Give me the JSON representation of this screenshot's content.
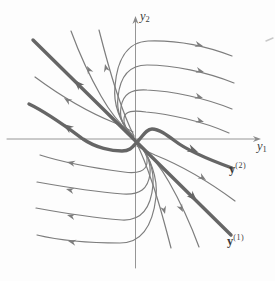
{
  "figure": {
    "colors": {
      "background": "#fdfdfd",
      "axis": "#8a8a8a",
      "thin_curve": "#7d7d7d",
      "thick_curve": "#666666",
      "text": "#3a3a3a",
      "artifact": "#c9c9c9"
    },
    "labels": {
      "x_axis": {
        "base": "y",
        "sub": "1"
      },
      "y_axis": {
        "base": "y",
        "sub": "2"
      },
      "eigen1": {
        "base": "y",
        "sup": "(1)"
      },
      "eigen2": {
        "base": "y",
        "sup": "(2)"
      }
    },
    "label_positions": {
      "x_axis": {
        "left": 257,
        "top": 140
      },
      "y_axis": {
        "left": 140,
        "top": 10
      },
      "eigen1": {
        "left": 227,
        "top": 234
      },
      "eigen2": {
        "left": 229,
        "top": 162
      }
    },
    "axes": {
      "x": {
        "path": "M 7 139 L 257 139",
        "arrow": {
          "x": 261,
          "y": 139,
          "a": 0
        }
      },
      "y": {
        "path": "M 135.5 268 L 135.5 20",
        "arrow": {
          "x": 135.5,
          "y": 16,
          "a": -90
        }
      }
    },
    "curves": [
      {
        "id": "eigen-solution-1-line",
        "kind": "thick",
        "path": "M 33 40 L 231 235",
        "arrows": [
          {
            "x": 74,
            "y": 80,
            "a": 225
          },
          {
            "x": 197,
            "y": 201,
            "a": 45
          }
        ]
      },
      {
        "id": "eigen-solution-2-curve",
        "kind": "thick",
        "path": "M 29 104 C 48 113 68 128 83 139 C 96 148 112 151 122 151 C 131 151 133 146 138 141 C 143 136 146 129 152 129 C 159 129 167 135 175 141 C 188 151 210 160 232 168",
        "arrows": [
          {
            "x": 63,
            "y": 124,
            "a": 215
          },
          {
            "x": 198,
            "y": 152,
            "a": 22
          }
        ]
      },
      {
        "id": "trajectory-nw-upper",
        "kind": "thin",
        "path": "M 35 77 C 62 97 90 113 115 123 C 122 126 128 129 133 132",
        "arrows": [
          {
            "x": 64,
            "y": 98,
            "a": 213
          }
        ]
      },
      {
        "id": "trajectory-se-lower",
        "kind": "thin",
        "path": "M 137 146 C 142 149 148 152 155 155 C 180 165 208 181 235 201",
        "arrows": [
          {
            "x": 206,
            "y": 180,
            "a": 33
          }
        ]
      },
      {
        "id": "trajectory-top-1",
        "kind": "thin",
        "path": "M 131 134 C 120 122 113 104 115 86 C 117 62 126 42 148 41 C 176 40 206 46 232 56",
        "arrows": [
          {
            "x": 203,
            "y": 46,
            "a": 14
          }
        ]
      },
      {
        "id": "trajectory-top-2",
        "kind": "thin",
        "path": "M 132 135 C 122 125 116 111 118 97 C 120 77 128 65 147 65 C 173 65 207 72 234 83",
        "arrows": [
          {
            "x": 204,
            "y": 72,
            "a": 15
          }
        ]
      },
      {
        "id": "trajectory-top-3",
        "kind": "thin",
        "path": "M 133 136 C 124 128 119 118 121 107 C 123 94 131 89 147 90 C 172 91 205 98 232 109",
        "arrows": [
          {
            "x": 203,
            "y": 98,
            "a": 16
          }
        ]
      },
      {
        "id": "trajectory-top-4",
        "kind": "thin",
        "path": "M 134 137 C 126 130 123 124 124 118 C 125 111 133 110 146 112 C 169 114 202 121 229 133",
        "arrows": [
          {
            "x": 204,
            "y": 122,
            "a": 17
          }
        ]
      },
      {
        "id": "trajectory-steep-up-1",
        "kind": "thin",
        "path": "M 71 31 C 78 50 89 75 101 96 C 110 112 122 126 131 134",
        "arrows": [
          {
            "x": 87,
            "y": 66,
            "a": -117
          }
        ]
      },
      {
        "id": "trajectory-steep-up-2",
        "kind": "thin",
        "path": "M 99 30 C 104 49 110 73 118 96 C 123 111 129 126 134 136",
        "arrows": [
          {
            "x": 105,
            "y": 64,
            "a": -104
          }
        ]
      },
      {
        "id": "trajectory-bottom-1",
        "kind": "thin",
        "path": "M 136 141 C 144 148 148 156 147 163 C 146 171 138 174 124 172 C 101 169 68 164 40 155",
        "arrows": [
          {
            "x": 67,
            "y": 162,
            "a": 193
          }
        ]
      },
      {
        "id": "trajectory-bottom-2",
        "kind": "thin",
        "path": "M 137 142 C 146 151 151 162 150 174 C 148 189 140 195 123 194 C 98 192 65 187 37 182",
        "arrows": [
          {
            "x": 66,
            "y": 189,
            "a": 194
          }
        ]
      },
      {
        "id": "trajectory-bottom-3",
        "kind": "thin",
        "path": "M 138 143 C 148 154 154 169 153 185 C 151 207 142 221 122 220 C 96 218 63 213 36 208",
        "arrows": [
          {
            "x": 67,
            "y": 215,
            "a": 194
          }
        ]
      },
      {
        "id": "trajectory-bottom-4",
        "kind": "thin",
        "path": "M 139 144 C 150 157 158 177 156 197 C 153 223 143 243 120 243 C 92 243 62 241 37 235",
        "arrows": [
          {
            "x": 68,
            "y": 241,
            "a": 193
          }
        ]
      },
      {
        "id": "trajectory-steep-down-1",
        "kind": "thin",
        "path": "M 199 247 C 192 228 181 203 169 182 C 160 166 148 152 139 144",
        "arrows": [
          {
            "x": 183,
            "y": 212,
            "a": 63
          }
        ]
      },
      {
        "id": "trajectory-steep-down-2",
        "kind": "thin",
        "path": "M 171 248 C 166 229 160 205 152 182 C 147 167 141 152 136 142",
        "arrows": [
          {
            "x": 165,
            "y": 214,
            "a": 76
          }
        ]
      }
    ],
    "artifact": {
      "path": "M 266 41 L 273 38"
    }
  }
}
